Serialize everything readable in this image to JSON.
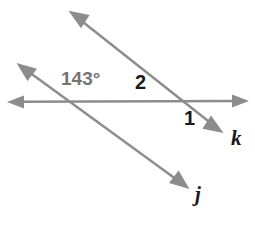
{
  "diagram": {
    "stroke_color": "#8c8c8c",
    "label_gray": "#757575",
    "label_dark": "#1a1a1a",
    "background": "#ffffff",
    "stroke_width": 2.4,
    "labels": {
      "angle_measure": "143°",
      "angle_two": "2",
      "angle_one": "1",
      "line_k": "k",
      "line_j": "j"
    },
    "lines": [
      {
        "name": "horizontal-line",
        "arrows": "both",
        "x1": 9,
        "y1": 102,
        "x2": 247,
        "y2": 101
      },
      {
        "name": "line-j",
        "arrows": "both",
        "x1": 18,
        "y1": 64,
        "x2": 188,
        "y2": 188
      },
      {
        "name": "line-k",
        "arrows": "both",
        "x1": 70,
        "y1": 12,
        "x2": 222,
        "y2": 132
      }
    ],
    "intersections": [
      {
        "name": "intersection-j-horizontal",
        "x": 72,
        "y": 102
      },
      {
        "name": "intersection-k-horizontal",
        "x": 190,
        "y": 101
      }
    ]
  }
}
